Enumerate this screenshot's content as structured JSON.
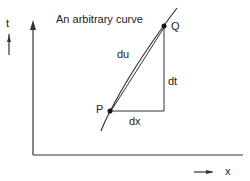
{
  "diagram": {
    "title": "An arbitrary curve",
    "axis_y_label": "t",
    "axis_x_label": "x",
    "point_p": "P",
    "point_q": "Q",
    "chord_label": "du",
    "vertical_label": "dt",
    "horizontal_label": "dx"
  }
}
